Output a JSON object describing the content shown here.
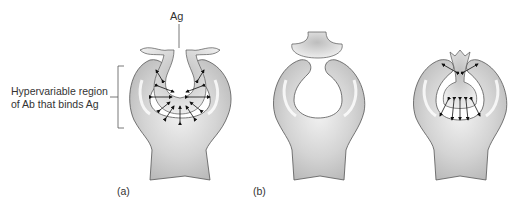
{
  "labels": {
    "antigen": "Ag",
    "region_line1": "Hypervariable region",
    "region_line2": "of Ab that binds Ag",
    "panel_a": "(a)",
    "panel_b": "(b)"
  },
  "colors": {
    "body_fill": "#c8c8c8",
    "body_light": "#ececec",
    "outline": "#555555",
    "arrow": "#111111"
  }
}
